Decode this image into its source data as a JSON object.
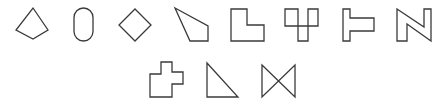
{
  "figure": {
    "background": "#ffffff",
    "stroke_color": "#3a3a3a",
    "rows": [
      {
        "shapes": [
          {
            "name": "kite",
            "points": "33,8 48,30 33,39 16,30"
          },
          {
            "name": "stadium",
            "rect": {
              "x": 74,
              "y": 8,
              "w": 19,
              "h": 33,
              "r": 9.5
            }
          },
          {
            "name": "diamond",
            "points": "135,9 151,25 135,41 119,25"
          },
          {
            "name": "irregular-quadrilateral",
            "points": "175,8 208,26 208,41 190,41"
          },
          {
            "name": "l-shape",
            "points": "231,9 247,9 247,25 264,25 264,41 231,41"
          },
          {
            "name": "fork-shape",
            "paths": [
              "M285,9 H298 V41 H308 V9 H318 V26 H285 Z"
            ]
          },
          {
            "name": "sideways-t-shape",
            "points": "343,9 350,9 350,18 374,18 374,31 350,31 350,41 343,41"
          },
          {
            "name": "n-shape",
            "points": "397,9 424,27 424,9 431,9 431,41 407,24 407,41 397,41"
          }
        ]
      },
      {
        "shapes": [
          {
            "name": "cross-shape",
            "points": "161,62 172,62 172,72 183,72 183,84 172,84 172,97 150,97 150,74 161,74"
          },
          {
            "name": "right-triangle",
            "points": "207,63 238,97 207,97"
          },
          {
            "name": "bowtie",
            "points": "262,65 295,97 295,65 262,97"
          }
        ]
      }
    ]
  }
}
